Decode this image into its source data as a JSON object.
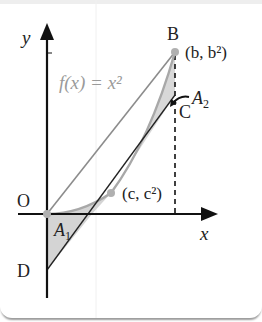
{
  "diagram": {
    "axes": {
      "x_label": "x",
      "y_label": "y"
    },
    "function_label": "f(x) = x²",
    "points": {
      "origin": {
        "label": "O"
      },
      "B": {
        "label": "B",
        "coords": "(b, b²)"
      },
      "C": {
        "label": "C"
      },
      "tangent_point": {
        "coords": "(c, c²)"
      },
      "D": {
        "label": "D"
      }
    },
    "regions": {
      "A1": {
        "label": "A",
        "sub": "1"
      },
      "A2": {
        "label": "A",
        "sub": "2"
      }
    },
    "colors": {
      "axis": "#111111",
      "curve": "#a8a8a8",
      "chord": "#8c8c8c",
      "tangent": "#222222",
      "shade": "#d4d4d4",
      "point": "#b0b0b0"
    }
  }
}
